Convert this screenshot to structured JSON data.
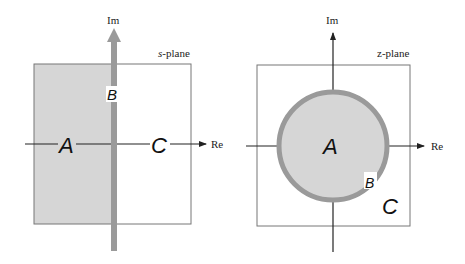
{
  "s_plane": {
    "title": "s-plane",
    "title_prefix": "s",
    "title_suffix": "-plane",
    "axis_im": "Im",
    "axis_re": "Re",
    "region_a": "A",
    "region_b": "B",
    "region_c": "C"
  },
  "z_plane": {
    "title": "z-plane",
    "axis_im": "Im",
    "axis_re": "Re",
    "region_a": "A",
    "region_b": "B",
    "region_c": "C"
  },
  "colors": {
    "shade": "#d6d6d6",
    "stripe": "#9a9a9a",
    "axis": "#222222",
    "box": "#777777"
  }
}
